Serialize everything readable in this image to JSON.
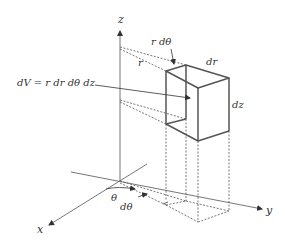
{
  "diagram": {
    "labels": {
      "z_axis": "z",
      "x_axis": "x",
      "y_axis": "y",
      "r_dtheta": "r dθ",
      "r": "r",
      "dr": "dr",
      "dz": "dz",
      "volume_formula": "dV = r dr dθ dz",
      "theta": "θ",
      "dtheta": "dθ"
    },
    "colors": {
      "axis": "#555555",
      "box": "#555555",
      "dashed": "#555555",
      "text": "#333333"
    }
  }
}
